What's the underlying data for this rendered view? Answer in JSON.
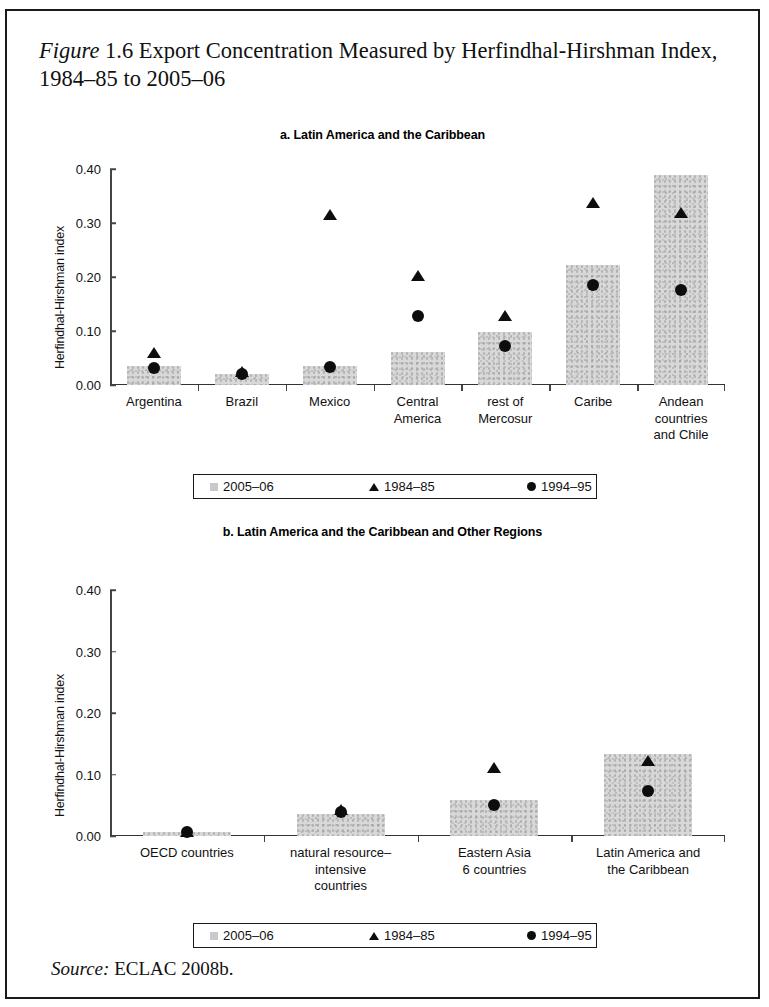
{
  "figure": {
    "label": "Figure",
    "number": "1.6",
    "title_rest": "Export Concentration Measured by Herfindhal-Hirshman Index, 1984–85 to 2005–06",
    "source_label": "Source:",
    "source_text": "ECLAC 2008b."
  },
  "legend": {
    "items": [
      {
        "marker": "square",
        "label": "2005–06"
      },
      {
        "marker": "triangle",
        "label": "1984–85"
      },
      {
        "marker": "circle",
        "label": "1994–95"
      }
    ]
  },
  "chart_data": [
    {
      "type": "bar",
      "panel": "a",
      "title": "a. Latin America and the Caribbean",
      "xlabel": "",
      "ylabel": "Herfindhal-Hirshman index",
      "ylim": [
        0.0,
        0.4
      ],
      "yticks": [
        "0.00",
        "0.10",
        "0.20",
        "0.30",
        "0.40"
      ],
      "ytick_values": [
        0.0,
        0.1,
        0.2,
        0.3,
        0.4
      ],
      "grid": false,
      "legend_position": "below",
      "categories": [
        "Argentina",
        "Brazil",
        "Mexico",
        "Central\nAmerica",
        "rest of\nMercosur",
        "Caribe",
        "Andean\ncountries\nand Chile"
      ],
      "series": [
        {
          "name": "2005–06",
          "marker": "bar",
          "values": [
            0.035,
            0.02,
            0.035,
            0.062,
            0.098,
            0.222,
            0.388
          ]
        },
        {
          "name": "1984–85",
          "marker": "triangle",
          "values": [
            0.06,
            0.025,
            0.315,
            0.202,
            0.127,
            0.337,
            0.318
          ]
        },
        {
          "name": "1994–95",
          "marker": "circle",
          "values": [
            0.032,
            0.021,
            0.034,
            0.128,
            0.072,
            0.185,
            0.176
          ]
        }
      ]
    },
    {
      "type": "bar",
      "panel": "b",
      "title": "b. Latin America and the Caribbean and Other Regions",
      "xlabel": "",
      "ylabel": "Herfindhal-Hirshman index",
      "ylim": [
        0.0,
        0.4
      ],
      "yticks": [
        "0.00",
        "0.10",
        "0.20",
        "0.30",
        "0.40"
      ],
      "ytick_values": [
        0.0,
        0.1,
        0.2,
        0.3,
        0.4
      ],
      "grid": false,
      "legend_position": "below",
      "categories": [
        "OECD countries",
        "natural resource–\nintensive\ncountries",
        "Eastern Asia\n6 countries",
        "Latin America and\nthe Caribbean"
      ],
      "series": [
        {
          "name": "2005–06",
          "marker": "bar",
          "values": [
            0.006,
            0.036,
            0.058,
            0.134
          ]
        },
        {
          "name": "1984–85",
          "marker": "triangle",
          "values": [
            0.007,
            0.042,
            0.11,
            0.122
          ]
        },
        {
          "name": "1994–95",
          "marker": "circle",
          "values": [
            0.006,
            0.039,
            0.05,
            0.073
          ]
        }
      ]
    }
  ]
}
